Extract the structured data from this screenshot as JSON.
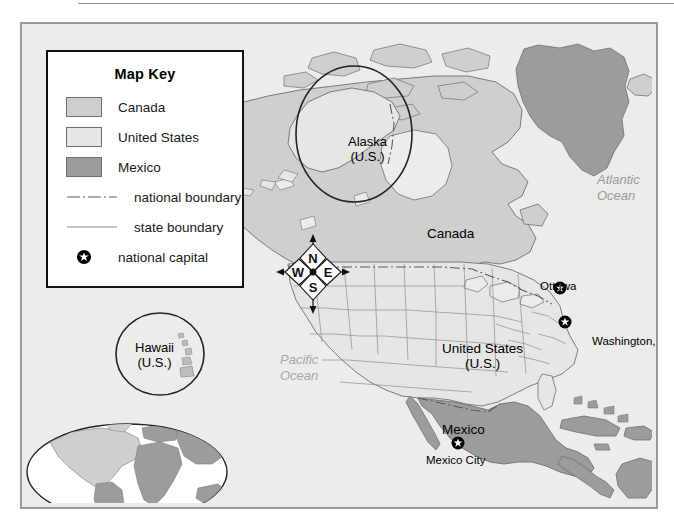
{
  "map": {
    "region_title": "North America",
    "key": {
      "title": "Map Key",
      "entries": [
        {
          "label": "Canada",
          "type": "area",
          "icon": "swatch-canada",
          "color": "#cfcfcd"
        },
        {
          "label": "United States",
          "type": "area",
          "icon": "swatch-united-states",
          "color": "#e6e6e4"
        },
        {
          "label": "Mexico",
          "type": "area",
          "icon": "swatch-mexico",
          "color": "#9c9c9a"
        },
        {
          "label": "national boundary",
          "type": "line",
          "icon": "dash-dot-line-icon",
          "color": "#5a5a5a"
        },
        {
          "label": "state boundary",
          "type": "line",
          "icon": "solid-line-icon",
          "color": "#8c8c8c"
        },
        {
          "label": "national capital",
          "type": "point",
          "icon": "national-capital-icon",
          "color": "#000000"
        }
      ]
    },
    "country_labels": [
      {
        "name": "canada-label",
        "text": "Canada"
      },
      {
        "name": "united-states-label",
        "line1": "United States",
        "line2": "(U.S.)"
      },
      {
        "name": "mexico-label",
        "text": "Mexico"
      }
    ],
    "inset_labels": [
      {
        "name": "alaska-inset-label",
        "line1": "Alaska",
        "line2": "(U.S.)"
      },
      {
        "name": "hawaii-inset-label",
        "line1": "Hawaii",
        "line2": "(U.S.)"
      }
    ],
    "capitals": [
      {
        "name": "ottawa",
        "text": "Ottawa"
      },
      {
        "name": "washington-dc",
        "text": "Washington, D.C."
      },
      {
        "name": "mexico-city",
        "text": "Mexico City"
      }
    ],
    "oceans": [
      {
        "name": "atlantic-ocean-label",
        "line1": "Atlantic",
        "line2": "Ocean"
      },
      {
        "name": "pacific-ocean-label",
        "line1": "Pacific",
        "line2": "Ocean"
      }
    ],
    "compass": {
      "north": "N",
      "south": "S",
      "east": "E",
      "west": "W"
    },
    "colors": {
      "ocean": "#ececea",
      "canada_fill": "#cfcfcd",
      "us_fill": "#e6e6e4",
      "mexico_fill": "#9c9c9a",
      "other_land_fill": "#9c9c9a",
      "frame_border": "#9a9a9a",
      "key_border": "#111111",
      "coastline": "#6e6e6e",
      "state_boundary": "#8c8c8c",
      "national_boundary": "#5a5a5a",
      "ocean_label": "#9a9a9a"
    }
  }
}
